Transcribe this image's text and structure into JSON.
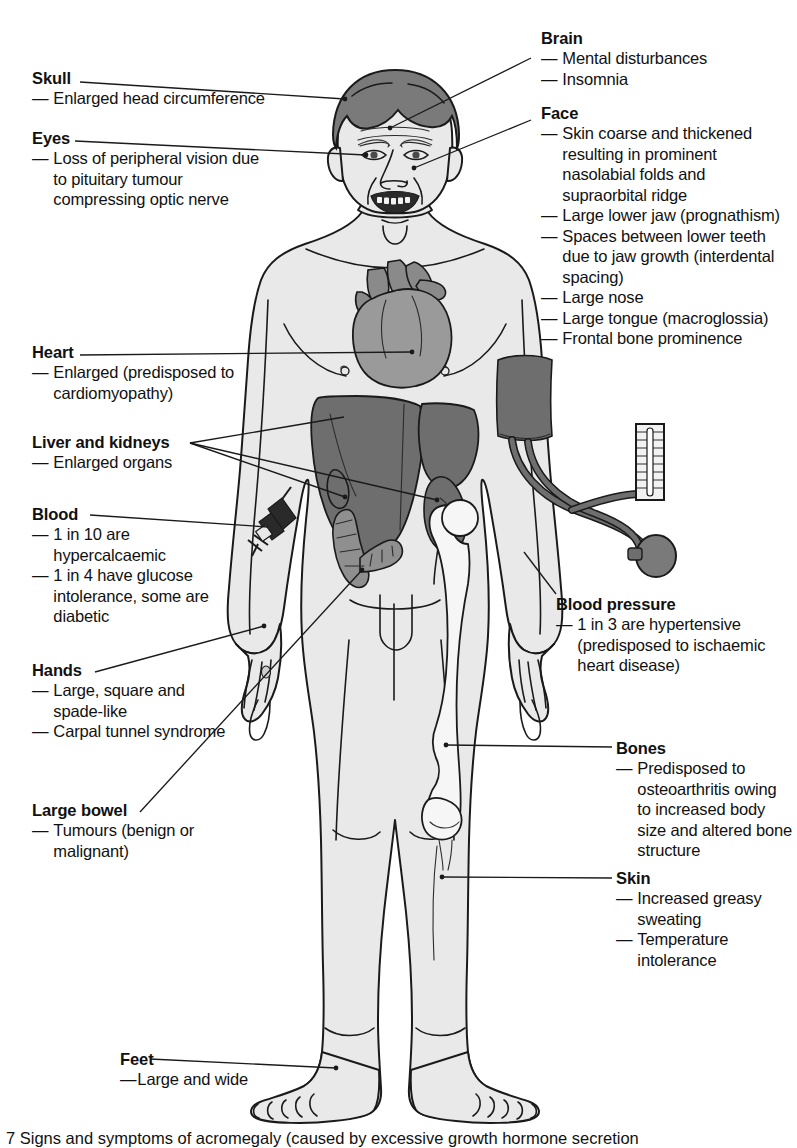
{
  "figure": {
    "caption": "7 Signs and symptoms of acromegaly (caused by excessive growth hormone secretion"
  },
  "colors": {
    "body_fill": "#e9e9e9",
    "outline": "#1a1a1a",
    "hair": "#7a7a7a",
    "heart": "#9a9a9a",
    "liver": "#6e6e6e",
    "kidney": "#6e6e6e",
    "bowel": "#8f8f8f",
    "bone": "#f4f4f4",
    "cuff": "#6e6e6e",
    "text": "#111111"
  },
  "labels_left": [
    {
      "id": "skull",
      "head": "Skull",
      "items": [
        "Enlarged head circumference"
      ]
    },
    {
      "id": "eyes",
      "head": "Eyes",
      "items": [
        "Loss of peripheral vision due to pituitary tumour compressing optic nerve"
      ]
    },
    {
      "id": "heart",
      "head": "Heart",
      "items": [
        "Enlarged (predisposed to cardiomyopathy)"
      ]
    },
    {
      "id": "liver-and-kidneys",
      "head": "Liver and kidneys",
      "items": [
        "Enlarged organs"
      ]
    },
    {
      "id": "blood",
      "head": "Blood",
      "items": [
        "1 in 10 are hypercalcaemic",
        "1 in 4 have glucose intolerance, some are diabetic"
      ]
    },
    {
      "id": "hands",
      "head": "Hands",
      "items": [
        "Large, square and spade-like",
        "Carpal tunnel syndrome"
      ]
    },
    {
      "id": "large-bowel",
      "head": "Large bowel",
      "items": [
        "Tumours (benign or malignant)"
      ]
    },
    {
      "id": "feet",
      "head": "Feet",
      "items": [
        "Large and wide"
      ]
    }
  ],
  "labels_right": [
    {
      "id": "brain",
      "head": "Brain",
      "items": [
        "Mental disturbances",
        "Insomnia"
      ]
    },
    {
      "id": "face",
      "head": "Face",
      "items": [
        "Skin coarse and thickened resulting in prominent nasolabial folds and supraorbital ridge",
        "Large lower jaw (prognathism)",
        "Spaces between lower teeth due to jaw growth (interdental spacing)",
        "Large nose",
        "Large tongue (macroglossia)",
        "Frontal bone prominence"
      ]
    },
    {
      "id": "blood-pressure",
      "head": "Blood pressure",
      "items": [
        "1 in 3 are hypertensive (predisposed to ischaemic heart disease)"
      ]
    },
    {
      "id": "bones",
      "head": "Bones",
      "items": [
        "Predisposed to osteoarthritis owing to increased body size and altered bone structure"
      ]
    },
    {
      "id": "skin",
      "head": "Skin",
      "items": [
        "Increased greasy sweating",
        "Temperature intolerance"
      ]
    }
  ]
}
